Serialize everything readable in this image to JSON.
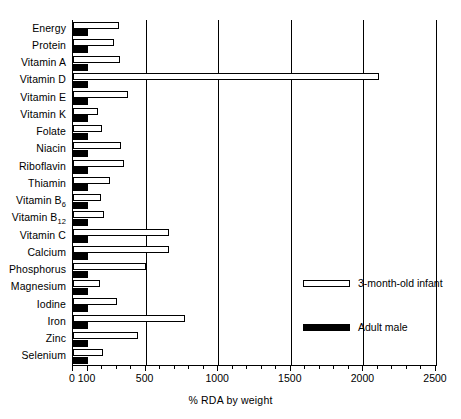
{
  "chart_data": {
    "type": "bar",
    "orientation": "horizontal",
    "title": "",
    "xlabel": "% RDA by weight",
    "ylabel": "",
    "xlim": [
      0,
      2500
    ],
    "xticks": [
      0,
      100,
      500,
      1000,
      1500,
      2000,
      2500
    ],
    "xtick_labels": [
      "0",
      "100",
      "500",
      "1000",
      "1500",
      "2000",
      "2500"
    ],
    "grid": true,
    "gridlines": [
      500,
      1000,
      1500,
      2000
    ],
    "legend_position": "center-right",
    "categories": [
      "Energy",
      "Protein",
      "Vitamin A",
      "Vitamin D",
      "Vitamin E",
      "Vitamin K",
      "Folate",
      "Niacin",
      "Riboflavin",
      "Thiamin",
      "Vitamin B6",
      "Vitamin B12",
      "Vitamin C",
      "Calcium",
      "Phosphorus",
      "Magnesium",
      "Iodine",
      "Iron",
      "Zinc",
      "Selenium"
    ],
    "category_labels_html": [
      "Energy",
      "Protein",
      "Vitamin A",
      "Vitamin D",
      "Vitamin E",
      "Vitamin K",
      "Folate",
      "Niacin",
      "Riboflavin",
      "Thiamin",
      "Vitamin B<sub>6</sub>",
      "Vitamin B<sub>12</sub>",
      "Vitamin C",
      "Calcium",
      "Phosphorus",
      "Magnesium",
      "Iodine",
      "Iron",
      "Zinc",
      "Selenium"
    ],
    "series": [
      {
        "name": "3-month-old infant",
        "color": "#ffffff",
        "edgecolor": "#000000",
        "values": [
          320,
          280,
          325,
          2110,
          380,
          170,
          200,
          330,
          350,
          255,
          195,
          215,
          660,
          660,
          500,
          185,
          300,
          770,
          450,
          210
        ]
      },
      {
        "name": "Adult male",
        "color": "#000000",
        "edgecolor": "#000000",
        "values": [
          100,
          100,
          100,
          100,
          100,
          100,
          100,
          100,
          100,
          100,
          100,
          100,
          100,
          100,
          100,
          100,
          100,
          100,
          100,
          100
        ]
      }
    ]
  },
  "legend": {
    "items": [
      {
        "label": "3-month-old infant",
        "style": "infant"
      },
      {
        "label": "Adult male",
        "style": "adult"
      }
    ]
  }
}
